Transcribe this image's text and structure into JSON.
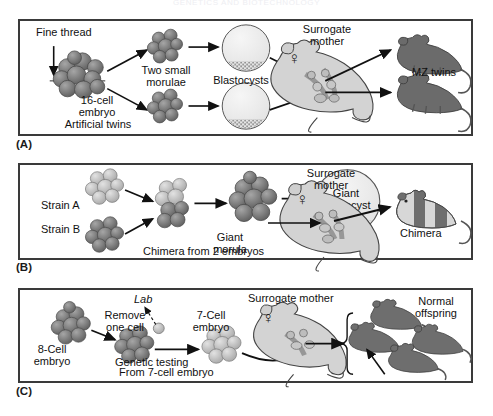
{
  "header": {
    "running_head": "GENETICS AND BIOTECHNOLOGY",
    "page_number": "55"
  },
  "figure": {
    "panels": [
      {
        "id": "A",
        "label": "(A)",
        "topic": "artificial-twinning",
        "labels": {
          "fine_thread": "Fine thread",
          "embryo_line1": "16-cell",
          "embryo_line2": "embryo",
          "artificial_twins": "Artificial twins",
          "two_small_line1": "Two small",
          "two_small_line2": "morulae",
          "blastocysts": "Blastocysts",
          "surrogate_line1": "Surrogate",
          "surrogate_line2": "mother",
          "mz_twins": "MZ twins"
        },
        "sex_symbol": "♀"
      },
      {
        "id": "B",
        "label": "(B)",
        "topic": "chimera-from-two-embryos",
        "labels": {
          "strain_a": "Strain A",
          "strain_b": "Strain B",
          "giant_morula_line1": "Giant",
          "giant_morula_line2": "morula",
          "giant_blastocyst_line1": "Giant",
          "giant_blastocyst_line2": "blastocyst",
          "chimera_caption": "Chimera from 2 embryos",
          "surrogate_line1": "Surrogate",
          "surrogate_line2": "mother",
          "chimera": "Chimera"
        },
        "sex_symbol": "♀"
      },
      {
        "id": "C",
        "label": "(C)",
        "topic": "preimplantation-genetic-testing",
        "labels": {
          "eight_cell_line1": "8-Cell",
          "eight_cell_line2": "embryo",
          "remove_line1": "Remove",
          "remove_line2": "one cell",
          "lab": "Lab",
          "seven_cell_line1": "7-Cell",
          "seven_cell_line2": "embryo",
          "genetic_testing": "Genetic testing",
          "surrogate_mother": "Surrogate mother",
          "normal_line1": "Normal",
          "normal_line2": "offspring",
          "from_seven": "From 7-cell embryo"
        },
        "sex_symbol": "♀"
      }
    ]
  },
  "colors": {
    "border": "#3a3a3a",
    "embryo_dark": "#6f6f6f",
    "embryo_light": "#b9b9b9",
    "mouse_dark": "#6e6e6e",
    "mouse_light": "#c9c9c9",
    "blastocyst_fill": "#ededed",
    "arrow": "#111111",
    "text": "#111111"
  }
}
